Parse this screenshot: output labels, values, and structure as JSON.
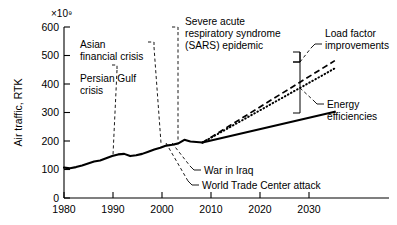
{
  "chart_data": {
    "type": "line",
    "title": "",
    "xlabel": "",
    "ylabel": "Air traffic, RTK",
    "y_exponent": "×10⁹",
    "xlim": [
      1980,
      2034
    ],
    "ylim": [
      0,
      620
    ],
    "grid": false,
    "legend": "none (inline annotations)",
    "xticks": [
      1980,
      1990,
      2000,
      2010,
      2020,
      2030
    ],
    "xtick_labels": [
      "1980",
      "1990",
      "2000",
      "2010",
      "2020",
      "2030"
    ],
    "yticks": [
      0,
      100,
      200,
      300,
      400,
      500,
      600
    ],
    "ytick_labels": [
      "0",
      "100",
      "200",
      "300",
      "400",
      "500",
      "600"
    ],
    "series": [
      {
        "name": "Historical air traffic",
        "style": "solid-thick",
        "x": [
          1980,
          1981,
          1982,
          1983,
          1984,
          1985,
          1986,
          1987,
          1988,
          1989,
          1990,
          1991,
          1992,
          1993,
          1994,
          1995,
          1996,
          1997,
          1998,
          1999,
          2000,
          2001,
          2002,
          2003
        ],
        "values": [
          110,
          108,
          112,
          118,
          125,
          132,
          136,
          144,
          152,
          158,
          160,
          152,
          155,
          160,
          168,
          176,
          182,
          190,
          193,
          198,
          211,
          205,
          203,
          201
        ]
      },
      {
        "name": "Baseline growth projection",
        "style": "dashed",
        "x": [
          2003,
          2025
        ],
        "values": [
          201,
          498
        ]
      },
      {
        "name": "Projection with load factor improvements",
        "style": "dotted",
        "x": [
          2003,
          2025
        ],
        "values": [
          201,
          470
        ]
      },
      {
        "name": "Projection with energy efficiencies",
        "style": "solid-thick",
        "x": [
          2003,
          2025
        ],
        "values": [
          201,
          313
        ]
      }
    ],
    "annotations": [
      {
        "label": "Asian\nfinancial crisis",
        "points_to_year": 1998,
        "points_to_value": 193
      },
      {
        "label": "Persian Gulf\ncrisis",
        "points_to_year": 1991,
        "points_to_value": 152
      },
      {
        "label": "Severe acute\nrespiratory syndrome\n(SARS) epidemic",
        "points_to_year": 2003,
        "points_to_value": 201
      },
      {
        "label": "War in Iraq",
        "points_to_year": 2003,
        "points_to_value": 201
      },
      {
        "label": "World Trade Center attack",
        "points_to_year": 2001,
        "points_to_value": 205
      },
      {
        "label": "Load factor\nimprovements",
        "points_to_year": 2025,
        "points_to_value": 484
      },
      {
        "label": "Energy\nefficiencies",
        "points_to_year": 2026,
        "points_to_value": 392
      }
    ]
  },
  "annotation_text": {
    "asian_l1": "Asian",
    "asian_l2": "financial crisis",
    "gulf_l1": "Persian Gulf",
    "gulf_l2": "crisis",
    "sars_l1": "Severe acute",
    "sars_l2": "respiratory syndrome",
    "sars_l3": "(SARS) epidemic",
    "iraq": "War in Iraq",
    "wtc": "World Trade Center attack",
    "load_l1": "Load factor",
    "load_l2": "improvements",
    "energy_l1": "Energy",
    "energy_l2": "efficiencies"
  },
  "axis_text": {
    "ylabel": "Air traffic, RTK",
    "exponent": "×10⁹",
    "x0": "1980",
    "x1": "1990",
    "x2": "2000",
    "x3": "2010",
    "x4": "2020",
    "x5": "2030",
    "y0": "0",
    "y1": "100",
    "y2": "200",
    "y3": "300",
    "y4": "400",
    "y5": "500",
    "y6": "600"
  },
  "colors": {
    "ink": "#000000",
    "background": "#ffffff"
  }
}
